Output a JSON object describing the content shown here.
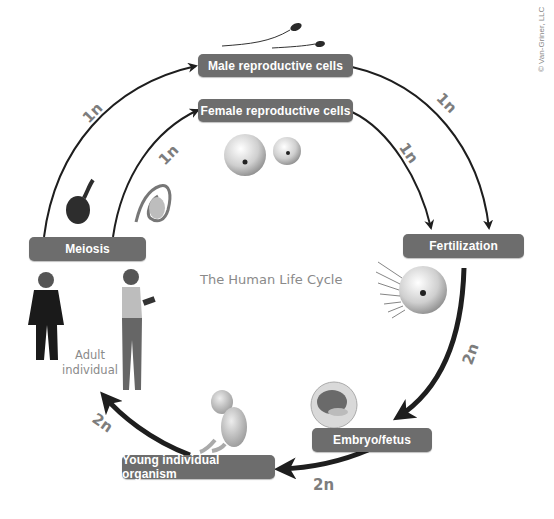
{
  "diagram": {
    "title": "The Human Life Cycle",
    "copyright": "© Van-Griner, LLC",
    "stages": {
      "male_cells": "Male reproductive cells",
      "female_cells": "Female reproductive cells",
      "fertilization": "Fertilization",
      "embryo": "Embryo/fetus",
      "young": "Young individual organism",
      "meiosis": "Meiosis"
    },
    "adult_label": [
      "Adult",
      "individual"
    ],
    "ploidy": {
      "meiosis_to_male": "1n",
      "meiosis_to_female": "1n",
      "male_to_fertilization": "1n",
      "female_to_fertilization": "1n",
      "fertilization_to_embryo": "2n",
      "embryo_to_young": "2n",
      "young_to_adult": "2n"
    },
    "colors": {
      "label_bg": "#6d6d6d",
      "label_text": "#ffffff",
      "arrow": "#1e1e1e",
      "ploidy_text": "#7d7d7d"
    }
  }
}
